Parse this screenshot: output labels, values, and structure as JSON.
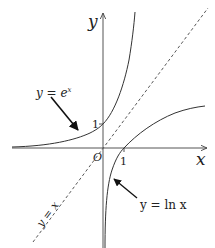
{
  "diagram": {
    "axes": {
      "x_label": "x",
      "y_label": "y",
      "origin_label": "O",
      "x_tick_label": "1",
      "y_tick_label": "1"
    },
    "curves": [
      {
        "name": "exponential",
        "label_prefix": "y = e",
        "label_sup": "x",
        "style": "solid"
      },
      {
        "name": "logarithm",
        "label": "y = ln x",
        "style": "solid"
      },
      {
        "name": "identity",
        "label": "y = x",
        "style": "dashed"
      }
    ],
    "colors": {
      "line": "#333333",
      "background": "#ffffff"
    }
  }
}
